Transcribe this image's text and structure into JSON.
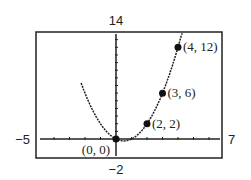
{
  "chart_data": {
    "type": "line",
    "title": "",
    "xlabel": "",
    "ylabel": "",
    "xlim": [
      -5,
      7
    ],
    "ylim": [
      -2,
      14
    ],
    "window_labels": {
      "ymax": "14",
      "ymin": "−2",
      "xmin": "−5",
      "xmax": "7"
    },
    "grid": false,
    "series": [
      {
        "name": "curve",
        "function": "y = x^2 - x",
        "x": [
          -3,
          -2,
          -1,
          0,
          1,
          2,
          3,
          4,
          4.2
        ],
        "values": [
          12,
          6,
          2,
          0,
          0,
          2,
          6,
          12,
          13.44
        ]
      }
    ],
    "points": [
      {
        "x": 0,
        "y": 0,
        "label": "(0, 0)"
      },
      {
        "x": 2,
        "y": 2,
        "label": "(2, 2)"
      },
      {
        "x": 3,
        "y": 6,
        "label": "(3, 6)"
      },
      {
        "x": 4,
        "y": 12,
        "label": "(4, 12)"
      }
    ]
  }
}
